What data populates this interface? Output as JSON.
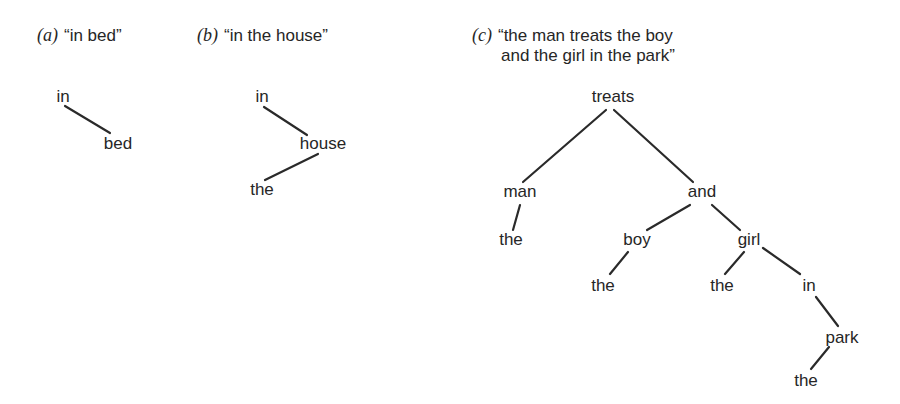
{
  "captions": {
    "a": {
      "tag": "(a)",
      "text": "“in bed”"
    },
    "b": {
      "tag": "(b)",
      "text": "“in the house”"
    },
    "c": {
      "tag": "(c)",
      "line1": "“the man treats the boy",
      "line2": "and the girl in the park”"
    }
  },
  "trees": {
    "a": {
      "nodes": [
        {
          "id": "in",
          "label": "in",
          "x": 63,
          "y": 97
        },
        {
          "id": "bed",
          "label": "bed",
          "x": 118,
          "y": 144
        }
      ],
      "edges": [
        [
          65,
          106,
          110,
          133
        ]
      ]
    },
    "b": {
      "nodes": [
        {
          "id": "in",
          "label": "in",
          "x": 262,
          "y": 97
        },
        {
          "id": "house",
          "label": "house",
          "x": 323,
          "y": 144
        },
        {
          "id": "the",
          "label": "the",
          "x": 262,
          "y": 190
        }
      ],
      "edges": [
        [
          264,
          107,
          307,
          135
        ],
        [
          318,
          154,
          265,
          180
        ]
      ]
    },
    "c": {
      "nodes": [
        {
          "id": "treats",
          "label": "treats",
          "x": 613,
          "y": 97
        },
        {
          "id": "man",
          "label": "man",
          "x": 520,
          "y": 192
        },
        {
          "id": "and",
          "label": "and",
          "x": 702,
          "y": 192
        },
        {
          "id": "the1",
          "label": "the",
          "x": 511,
          "y": 240
        },
        {
          "id": "boy",
          "label": "boy",
          "x": 637,
          "y": 240
        },
        {
          "id": "girl",
          "label": "girl",
          "x": 749,
          "y": 240
        },
        {
          "id": "the2",
          "label": "the",
          "x": 603,
          "y": 286
        },
        {
          "id": "the3",
          "label": "the",
          "x": 722,
          "y": 286
        },
        {
          "id": "in",
          "label": "in",
          "x": 809,
          "y": 286
        },
        {
          "id": "park",
          "label": "park",
          "x": 842,
          "y": 338
        },
        {
          "id": "the4",
          "label": "the",
          "x": 806,
          "y": 381
        }
      ],
      "edges": [
        [
          606,
          110,
          523,
          182
        ],
        [
          614,
          110,
          693,
          182
        ],
        [
          520,
          205,
          513,
          230
        ],
        [
          690,
          205,
          647,
          230
        ],
        [
          712,
          205,
          740,
          230
        ],
        [
          628,
          252,
          610,
          274
        ],
        [
          744,
          252,
          725,
          274
        ],
        [
          763,
          248,
          800,
          274
        ],
        [
          816,
          297,
          838,
          326
        ],
        [
          829,
          347,
          811,
          369
        ]
      ]
    }
  }
}
